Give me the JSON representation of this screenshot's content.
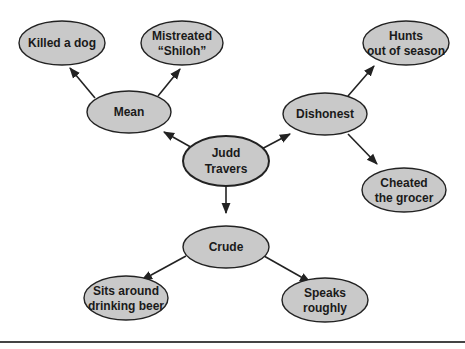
{
  "diagram": {
    "type": "character-web",
    "colors": {
      "node_fill": "#c9c9c9",
      "node_stroke": "#222222",
      "edge": "#222222",
      "background": "#ffffff"
    },
    "center": {
      "id": "judd",
      "lines": [
        "Judd",
        "Travers"
      ]
    },
    "nodes": [
      {
        "id": "mean",
        "lines": [
          "Mean"
        ]
      },
      {
        "id": "dishonest",
        "lines": [
          "Dishonest"
        ]
      },
      {
        "id": "crude",
        "lines": [
          "Crude"
        ]
      },
      {
        "id": "killed",
        "lines": [
          "Killed a dog"
        ]
      },
      {
        "id": "mistreated",
        "lines": [
          "Mistreated",
          "“Shiloh”"
        ]
      },
      {
        "id": "hunts",
        "lines": [
          "Hunts",
          "out of season"
        ]
      },
      {
        "id": "cheated",
        "lines": [
          "Cheated",
          "the grocer"
        ]
      },
      {
        "id": "sits",
        "lines": [
          "Sits around",
          "drinking beer"
        ]
      },
      {
        "id": "speaks",
        "lines": [
          "Speaks",
          "roughly"
        ]
      }
    ],
    "edges": [
      {
        "from": "judd",
        "to": "mean"
      },
      {
        "from": "judd",
        "to": "dishonest"
      },
      {
        "from": "judd",
        "to": "crude"
      },
      {
        "from": "mean",
        "to": "killed"
      },
      {
        "from": "mean",
        "to": "mistreated"
      },
      {
        "from": "dishonest",
        "to": "hunts"
      },
      {
        "from": "dishonest",
        "to": "cheated"
      },
      {
        "from": "crude",
        "to": "sits"
      },
      {
        "from": "crude",
        "to": "speaks"
      }
    ]
  }
}
